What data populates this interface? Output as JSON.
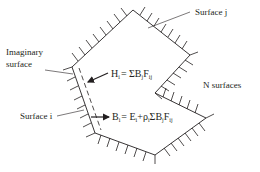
{
  "diagram": {
    "type": "enclosure-radiation-schematic",
    "labels": {
      "surface_j": "Surface j",
      "imaginary_surface_line1": "Imaginary",
      "imaginary_surface_line2": "surface",
      "surface_i": "Surface i",
      "n_surfaces": "N surfaces"
    },
    "equations": {
      "irradiation": {
        "lhs": "H",
        "lhs_sub": "i",
        "rhs": "= ΣB",
        "rhs_sub1": "j",
        "rhs2": "F",
        "rhs_sub2": "ij"
      },
      "radiosity": {
        "lhs": "B",
        "lhs_sub": "i",
        "rhs_a": "= E",
        "rhs_a_sub": "i",
        "rhs_b": "+ρ",
        "rhs_b_sub": "i",
        "rhs_c": "ΣB",
        "rhs_c_sub": "j",
        "rhs_d": "F",
        "rhs_d_sub": "ij"
      }
    },
    "colors": {
      "line": "#231f20",
      "background": "#ffffff"
    }
  }
}
